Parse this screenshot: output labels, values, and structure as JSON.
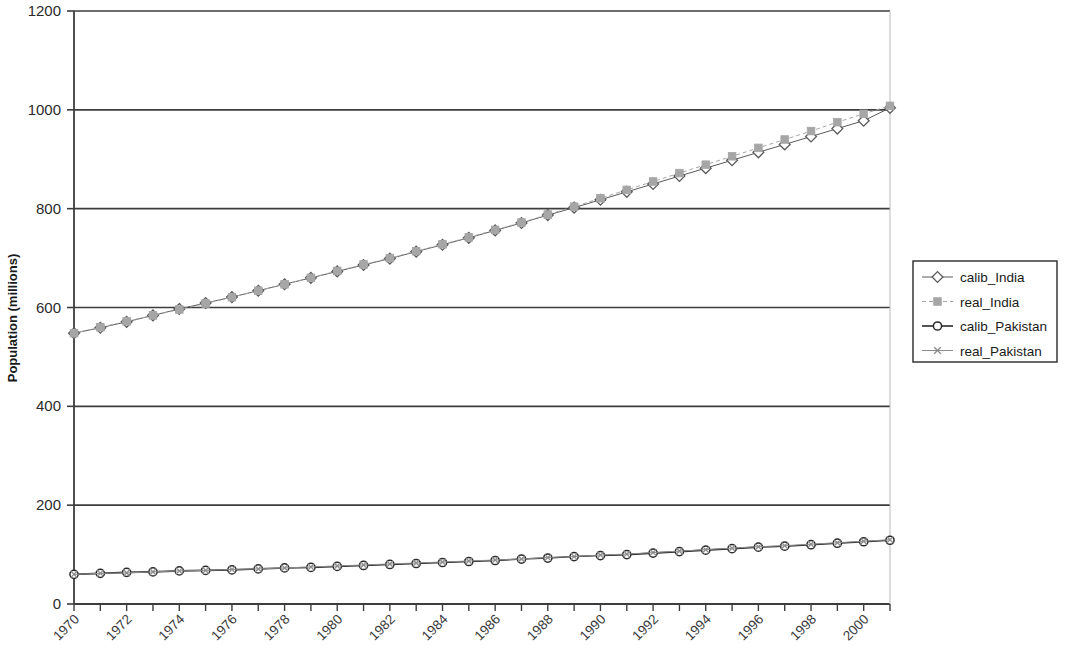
{
  "chart_data": {
    "type": "line",
    "title": "",
    "xlabel": "",
    "ylabel": "Population (millions)",
    "xlim": [
      1970,
      2001
    ],
    "ylim": [
      0,
      1200
    ],
    "ytick_values": [
      0,
      200,
      400,
      600,
      800,
      1000,
      1200
    ],
    "ytick_labels": [
      "0",
      "200",
      "400",
      "600",
      "800",
      "1000",
      "1200"
    ],
    "xtick_values": [
      1970,
      1972,
      1974,
      1976,
      1978,
      1980,
      1982,
      1984,
      1986,
      1988,
      1990,
      1992,
      1994,
      1996,
      1998,
      2000
    ],
    "xtick_labels": [
      "1970",
      "1972",
      "1974",
      "1976",
      "1978",
      "1980",
      "1982",
      "1984",
      "1986",
      "1988",
      "1990",
      "1992",
      "1994",
      "1996",
      "1998",
      "2000"
    ],
    "xtick_rotation": 45,
    "grid": "horizontal",
    "legend_position": "right",
    "x": [
      1970,
      1971,
      1972,
      1973,
      1974,
      1975,
      1976,
      1977,
      1978,
      1979,
      1980,
      1981,
      1982,
      1983,
      1984,
      1985,
      1986,
      1987,
      1988,
      1989,
      1990,
      1991,
      1992,
      1993,
      1994,
      1995,
      1996,
      1997,
      1998,
      1999,
      2000,
      2001
    ],
    "series": [
      {
        "name": "calib_India",
        "color": "#5a5a5a",
        "marker": "diamond-open",
        "linestyle": "solid",
        "linewidth": 1,
        "values": [
          548,
          559,
          571,
          584,
          597,
          609,
          621,
          634,
          647,
          660,
          673,
          686,
          699,
          713,
          727,
          741,
          756,
          771,
          787,
          802,
          818,
          834,
          850,
          866,
          882,
          898,
          914,
          930,
          946,
          962,
          978,
          1004
        ]
      },
      {
        "name": "real_India",
        "color": "#a6a6a6",
        "marker": "square-filled",
        "linestyle": "dashed",
        "linewidth": 1,
        "values": [
          548,
          560,
          572,
          584,
          596,
          608,
          621,
          634,
          647,
          660,
          674,
          687,
          700,
          714,
          728,
          742,
          757,
          772,
          788,
          804,
          821,
          838,
          855,
          872,
          889,
          906,
          923,
          940,
          957,
          975,
          992,
          1008
        ]
      },
      {
        "name": "calib_Pakistan",
        "color": "#2a2a2a",
        "marker": "circle-open",
        "linestyle": "solid",
        "linewidth": 1.6,
        "values": [
          60,
          62,
          64,
          65,
          67,
          68,
          69,
          71,
          73,
          74,
          76,
          78,
          80,
          82,
          84,
          86,
          88,
          91,
          93,
          96,
          98,
          100,
          103,
          106,
          109,
          112,
          115,
          117,
          120,
          123,
          126,
          129
        ]
      },
      {
        "name": "real_Pakistan",
        "color": "#8c8c8c",
        "marker": "x",
        "linestyle": "solid",
        "linewidth": 1,
        "values": [
          60,
          62,
          63,
          65,
          67,
          68,
          70,
          71,
          73,
          75,
          77,
          79,
          81,
          83,
          85,
          87,
          89,
          91,
          94,
          96,
          99,
          101,
          104,
          107,
          110,
          113,
          116,
          118,
          121,
          124,
          127,
          130
        ]
      }
    ]
  },
  "legend": {
    "entries": [
      {
        "label": "calib_India"
      },
      {
        "label": "real_India"
      },
      {
        "label": "calib_Pakistan"
      },
      {
        "label": "real_Pakistan"
      }
    ]
  },
  "axes": {
    "y_title": "Population (millions)"
  }
}
